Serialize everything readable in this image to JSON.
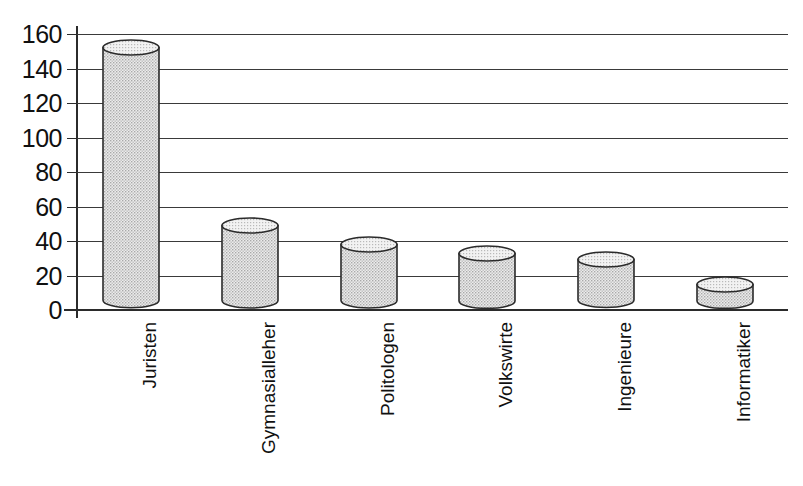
{
  "chart_data": {
    "type": "bar",
    "title": "",
    "subtitle": "",
    "xlabel": "",
    "ylabel": "",
    "categories": [
      "Juristen",
      "Gymnasialleher",
      "Politologen",
      "Volkswirte",
      "Ingenieure",
      "Informatiker"
    ],
    "values": [
      152,
      49,
      38,
      33,
      29,
      15
    ],
    "ylim": [
      0,
      160
    ],
    "ytick_step": 20,
    "yticks": [
      "160",
      "140",
      "120",
      "100",
      "80",
      "60",
      "40",
      "20",
      "0"
    ],
    "ytick_values": [
      160,
      140,
      120,
      100,
      80,
      60,
      40,
      20,
      0
    ],
    "grid": true,
    "legend": false,
    "legend_position": "none",
    "bar_style": "cylinder-3d",
    "colors": {
      "bar_fill": "#d4d4d4",
      "bar_outline": "#2b2b2b",
      "bar_top_fill": "#e6e6e6",
      "gridline": "#3a3a3a",
      "axis": "#2b2b2b",
      "background": "#ffffff",
      "text": "#101010"
    }
  }
}
